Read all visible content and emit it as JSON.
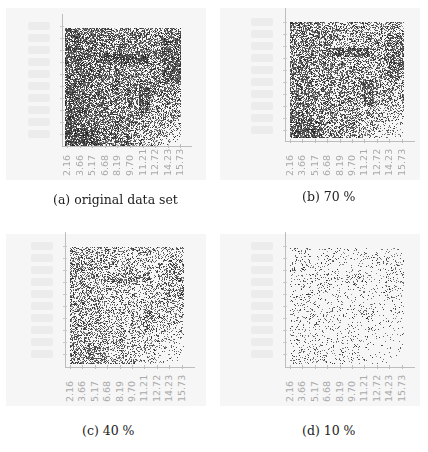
{
  "figure": {
    "panels": [
      {
        "id": "a",
        "caption": "(a) original data set",
        "density": 1.0
      },
      {
        "id": "b",
        "caption": "(b) 70 %",
        "density": 0.7
      },
      {
        "id": "c",
        "caption": "(c) 40 %",
        "density": 0.4
      },
      {
        "id": "d",
        "caption": "(d) 10 %",
        "density": 0.1
      }
    ],
    "x_tick_labels": [
      "2.16",
      "3.66",
      "5.17",
      "6.68",
      "8.19",
      "9.70",
      "11.21",
      "12.72",
      "14.23",
      "15.73"
    ]
  },
  "chart_data": [
    {
      "type": "scatter",
      "title": "(a) original data set",
      "sample_fraction": 1.0,
      "xticks": [
        "2.16",
        "3.66",
        "5.17",
        "6.68",
        "8.19",
        "9.70",
        "11.21",
        "12.72",
        "14.23",
        "15.73"
      ],
      "xlim": [
        2.16,
        15.73
      ],
      "grid": false,
      "legend": null
    },
    {
      "type": "scatter",
      "title": "(b) 70 %",
      "sample_fraction": 0.7,
      "xticks": [
        "2.16",
        "3.66",
        "5.17",
        "6.68",
        "8.19",
        "9.70",
        "11.21",
        "12.72",
        "14.23",
        "15.73"
      ],
      "xlim": [
        2.16,
        15.73
      ],
      "grid": false,
      "legend": null
    },
    {
      "type": "scatter",
      "title": "(c) 40 %",
      "sample_fraction": 0.4,
      "xticks": [
        "2.16",
        "3.66",
        "5.17",
        "6.68",
        "8.19",
        "9.70",
        "11.21",
        "12.72",
        "14.23",
        "15.73"
      ],
      "xlim": [
        2.16,
        15.73
      ],
      "grid": false,
      "legend": null
    },
    {
      "type": "scatter",
      "title": "(d) 10 %",
      "sample_fraction": 0.1,
      "xticks": [
        "2.16",
        "3.66",
        "5.17",
        "6.68",
        "8.19",
        "9.70",
        "11.21",
        "12.72",
        "14.23",
        "15.73"
      ],
      "xlim": [
        2.16,
        15.73
      ],
      "grid": false,
      "legend": null
    }
  ]
}
